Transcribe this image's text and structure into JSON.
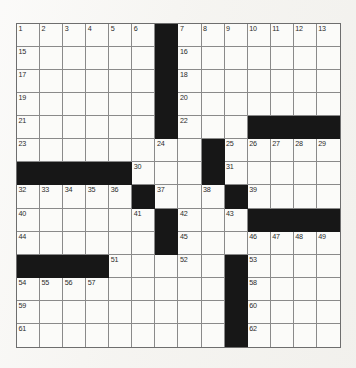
{
  "page": {
    "background_color": "#f6f5f2"
  },
  "grid": {
    "name": "crossword-grid",
    "rows": 14,
    "columns": 14,
    "cell_size_px": 23,
    "block_color": "#171717",
    "cell_color": "#fbfbf9",
    "border_color": "#8a8a8a",
    "highest_clue_number": 64,
    "cells": [
      [
        {
          "type": "open",
          "number": "1"
        },
        {
          "type": "open",
          "number": "2"
        },
        {
          "type": "open",
          "number": "3"
        },
        {
          "type": "open",
          "number": "4"
        },
        {
          "type": "open",
          "number": "5"
        },
        {
          "type": "open",
          "number": "6"
        },
        {
          "type": "block",
          "number": ""
        },
        {
          "type": "open",
          "number": "7"
        },
        {
          "type": "open",
          "number": "8"
        },
        {
          "type": "open",
          "number": "9"
        },
        {
          "type": "open",
          "number": "10"
        },
        {
          "type": "open",
          "number": "11"
        },
        {
          "type": "open",
          "number": "12"
        },
        {
          "type": "open",
          "number": "13"
        }
      ],
      [
        {
          "type": "open",
          "number": "15"
        },
        {
          "type": "open",
          "number": ""
        },
        {
          "type": "open",
          "number": ""
        },
        {
          "type": "open",
          "number": ""
        },
        {
          "type": "open",
          "number": ""
        },
        {
          "type": "open",
          "number": ""
        },
        {
          "type": "block",
          "number": ""
        },
        {
          "type": "open",
          "number": "16"
        },
        {
          "type": "open",
          "number": ""
        },
        {
          "type": "open",
          "number": ""
        },
        {
          "type": "open",
          "number": ""
        },
        {
          "type": "open",
          "number": ""
        },
        {
          "type": "open",
          "number": ""
        },
        {
          "type": "open",
          "number": ""
        }
      ],
      [
        {
          "type": "open",
          "number": "17"
        },
        {
          "type": "open",
          "number": ""
        },
        {
          "type": "open",
          "number": ""
        },
        {
          "type": "open",
          "number": ""
        },
        {
          "type": "open",
          "number": ""
        },
        {
          "type": "open",
          "number": ""
        },
        {
          "type": "block",
          "number": ""
        },
        {
          "type": "open",
          "number": "18"
        },
        {
          "type": "open",
          "number": ""
        },
        {
          "type": "open",
          "number": ""
        },
        {
          "type": "open",
          "number": ""
        },
        {
          "type": "open",
          "number": ""
        },
        {
          "type": "open",
          "number": ""
        },
        {
          "type": "open",
          "number": ""
        }
      ],
      [
        {
          "type": "open",
          "number": "19"
        },
        {
          "type": "open",
          "number": ""
        },
        {
          "type": "open",
          "number": ""
        },
        {
          "type": "open",
          "number": ""
        },
        {
          "type": "open",
          "number": ""
        },
        {
          "type": "open",
          "number": ""
        },
        {
          "type": "block",
          "number": ""
        },
        {
          "type": "open",
          "number": "20"
        },
        {
          "type": "open",
          "number": ""
        },
        {
          "type": "open",
          "number": ""
        },
        {
          "type": "open",
          "number": ""
        },
        {
          "type": "open",
          "number": ""
        },
        {
          "type": "open",
          "number": ""
        },
        {
          "type": "open",
          "number": ""
        }
      ],
      [
        {
          "type": "open",
          "number": "21"
        },
        {
          "type": "open",
          "number": ""
        },
        {
          "type": "open",
          "number": ""
        },
        {
          "type": "open",
          "number": ""
        },
        {
          "type": "open",
          "number": ""
        },
        {
          "type": "open",
          "number": ""
        },
        {
          "type": "block",
          "number": ""
        },
        {
          "type": "open",
          "number": "22"
        },
        {
          "type": "open",
          "number": ""
        },
        {
          "type": "open",
          "number": ""
        },
        {
          "type": "block",
          "number": ""
        },
        {
          "type": "block",
          "number": ""
        },
        {
          "type": "block",
          "number": ""
        },
        {
          "type": "block",
          "number": ""
        }
      ],
      [
        {
          "type": "open",
          "number": "23"
        },
        {
          "type": "open",
          "number": ""
        },
        {
          "type": "open",
          "number": ""
        },
        {
          "type": "open",
          "number": ""
        },
        {
          "type": "open",
          "number": ""
        },
        {
          "type": "open",
          "number": ""
        },
        {
          "type": "open",
          "number": "24"
        },
        {
          "type": "open",
          "number": ""
        },
        {
          "type": "block",
          "number": ""
        },
        {
          "type": "open",
          "number": "25"
        },
        {
          "type": "open",
          "number": "26"
        },
        {
          "type": "open",
          "number": "27"
        },
        {
          "type": "open",
          "number": "28"
        },
        {
          "type": "open",
          "number": "29"
        }
      ],
      [
        {
          "type": "block",
          "number": ""
        },
        {
          "type": "block",
          "number": ""
        },
        {
          "type": "block",
          "number": ""
        },
        {
          "type": "block",
          "number": ""
        },
        {
          "type": "block",
          "number": ""
        },
        {
          "type": "open",
          "number": "30"
        },
        {
          "type": "open",
          "number": ""
        },
        {
          "type": "open",
          "number": ""
        },
        {
          "type": "block",
          "number": ""
        },
        {
          "type": "open",
          "number": "31"
        },
        {
          "type": "open",
          "number": ""
        },
        {
          "type": "open",
          "number": ""
        },
        {
          "type": "open",
          "number": ""
        },
        {
          "type": "open",
          "number": ""
        }
      ],
      [
        {
          "type": "open",
          "number": "32"
        },
        {
          "type": "open",
          "number": "33"
        },
        {
          "type": "open",
          "number": "34"
        },
        {
          "type": "open",
          "number": "35"
        },
        {
          "type": "open",
          "number": "36"
        },
        {
          "type": "block",
          "number": ""
        },
        {
          "type": "open",
          "number": "37"
        },
        {
          "type": "open",
          "number": ""
        },
        {
          "type": "open",
          "number": "38"
        },
        {
          "type": "block",
          "number": ""
        },
        {
          "type": "open",
          "number": "39"
        },
        {
          "type": "open",
          "number": ""
        },
        {
          "type": "open",
          "number": ""
        },
        {
          "type": "open",
          "number": ""
        }
      ],
      [
        {
          "type": "open",
          "number": "40"
        },
        {
          "type": "open",
          "number": ""
        },
        {
          "type": "open",
          "number": ""
        },
        {
          "type": "open",
          "number": ""
        },
        {
          "type": "open",
          "number": ""
        },
        {
          "type": "open",
          "number": "41"
        },
        {
          "type": "block",
          "number": ""
        },
        {
          "type": "open",
          "number": "42"
        },
        {
          "type": "open",
          "number": ""
        },
        {
          "type": "open",
          "number": "43"
        },
        {
          "type": "block",
          "number": ""
        },
        {
          "type": "block",
          "number": ""
        },
        {
          "type": "block",
          "number": ""
        },
        {
          "type": "block",
          "number": ""
        }
      ],
      [
        {
          "type": "open",
          "number": "44"
        },
        {
          "type": "open",
          "number": ""
        },
        {
          "type": "open",
          "number": ""
        },
        {
          "type": "open",
          "number": ""
        },
        {
          "type": "open",
          "number": ""
        },
        {
          "type": "open",
          "number": ""
        },
        {
          "type": "block",
          "number": ""
        },
        {
          "type": "open",
          "number": "45"
        },
        {
          "type": "open",
          "number": ""
        },
        {
          "type": "open",
          "number": ""
        },
        {
          "type": "open",
          "number": "46"
        },
        {
          "type": "open",
          "number": "47"
        },
        {
          "type": "open",
          "number": "48"
        },
        {
          "type": "open",
          "number": "49"
        }
      ],
      [
        {
          "type": "block",
          "number": ""
        },
        {
          "type": "block",
          "number": ""
        },
        {
          "type": "block",
          "number": ""
        },
        {
          "type": "block",
          "number": ""
        },
        {
          "type": "open",
          "number": "51"
        },
        {
          "type": "open",
          "number": ""
        },
        {
          "type": "open",
          "number": ""
        },
        {
          "type": "open",
          "number": "52"
        },
        {
          "type": "open",
          "number": ""
        },
        {
          "type": "block",
          "number": ""
        },
        {
          "type": "open",
          "number": "53"
        },
        {
          "type": "open",
          "number": ""
        },
        {
          "type": "open",
          "number": ""
        },
        {
          "type": "open",
          "number": ""
        }
      ],
      [
        {
          "type": "open",
          "number": "54"
        },
        {
          "type": "open",
          "number": "55"
        },
        {
          "type": "open",
          "number": "56"
        },
        {
          "type": "open",
          "number": "57"
        },
        {
          "type": "open",
          "number": ""
        },
        {
          "type": "open",
          "number": ""
        },
        {
          "type": "open",
          "number": ""
        },
        {
          "type": "open",
          "number": ""
        },
        {
          "type": "open",
          "number": ""
        },
        {
          "type": "block",
          "number": ""
        },
        {
          "type": "open",
          "number": "58"
        },
        {
          "type": "open",
          "number": ""
        },
        {
          "type": "open",
          "number": ""
        },
        {
          "type": "open",
          "number": ""
        }
      ],
      [
        {
          "type": "open",
          "number": "59"
        },
        {
          "type": "open",
          "number": ""
        },
        {
          "type": "open",
          "number": ""
        },
        {
          "type": "open",
          "number": ""
        },
        {
          "type": "open",
          "number": ""
        },
        {
          "type": "open",
          "number": ""
        },
        {
          "type": "open",
          "number": ""
        },
        {
          "type": "open",
          "number": ""
        },
        {
          "type": "open",
          "number": ""
        },
        {
          "type": "block",
          "number": ""
        },
        {
          "type": "open",
          "number": "60"
        },
        {
          "type": "open",
          "number": ""
        },
        {
          "type": "open",
          "number": ""
        },
        {
          "type": "open",
          "number": ""
        }
      ],
      [
        {
          "type": "open",
          "number": "61"
        },
        {
          "type": "open",
          "number": ""
        },
        {
          "type": "open",
          "number": ""
        },
        {
          "type": "open",
          "number": ""
        },
        {
          "type": "open",
          "number": ""
        },
        {
          "type": "open",
          "number": ""
        },
        {
          "type": "open",
          "number": ""
        },
        {
          "type": "open",
          "number": ""
        },
        {
          "type": "open",
          "number": ""
        },
        {
          "type": "block",
          "number": ""
        },
        {
          "type": "open",
          "number": "62"
        },
        {
          "type": "open",
          "number": ""
        },
        {
          "type": "open",
          "number": ""
        },
        {
          "type": "open",
          "number": ""
        }
      ]
    ],
    "extra_rows_note": ""
  },
  "extra": {
    "row15": [
      {
        "type": "open",
        "number": "63"
      },
      {
        "type": "open",
        "number": ""
      },
      {
        "type": "open",
        "number": ""
      },
      {
        "type": "open",
        "number": ""
      },
      {
        "type": "open",
        "number": ""
      },
      {
        "type": "open",
        "number": ""
      },
      {
        "type": "open",
        "number": ""
      },
      {
        "type": "open",
        "number": ""
      },
      {
        "type": "open",
        "number": ""
      },
      {
        "type": "block",
        "number": ""
      },
      {
        "type": "open",
        "number": "64"
      },
      {
        "type": "open",
        "number": ""
      },
      {
        "type": "open",
        "number": ""
      },
      {
        "type": "open",
        "number": ""
      }
    ]
  }
}
